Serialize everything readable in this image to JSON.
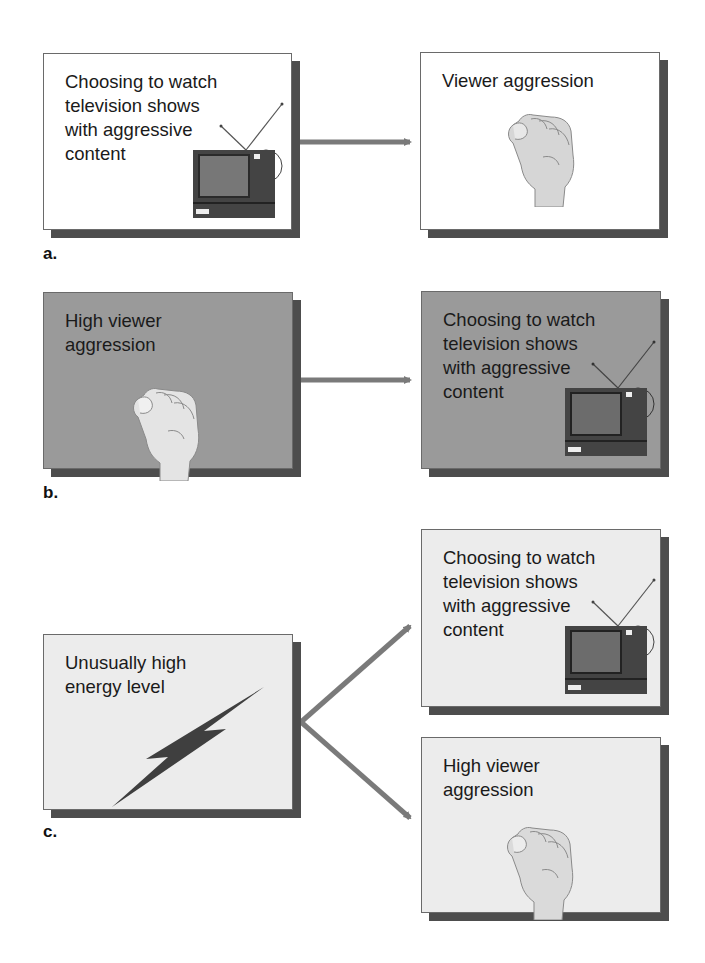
{
  "diagram": {
    "parts": [
      {
        "id": "a",
        "label": "a.",
        "source": {
          "text": "Choosing to watch\ntelevision shows\nwith aggressive\ncontent",
          "icon": "television-icon"
        },
        "targets": [
          {
            "text": "Viewer aggression",
            "icon": "fist-icon"
          }
        ]
      },
      {
        "id": "b",
        "label": "b.",
        "source": {
          "text": "High viewer\naggression",
          "icon": "fist-icon"
        },
        "targets": [
          {
            "text": "Choosing to watch\ntelevision shows\nwith aggressive\ncontent",
            "icon": "television-icon"
          }
        ]
      },
      {
        "id": "c",
        "label": "c.",
        "source": {
          "text": "Unusually high\nenergy level",
          "icon": "lightning-bolt-icon"
        },
        "targets": [
          {
            "text": "Choosing to watch\ntelevision shows\nwith aggressive\ncontent",
            "icon": "television-icon"
          },
          {
            "text": "High viewer\naggression",
            "icon": "fist-icon"
          }
        ]
      }
    ],
    "colors": {
      "arrow": "#7a7a7a",
      "shadow": "#4d4d4d",
      "panel_a": "#ffffff",
      "panel_b": "#9a9a9a",
      "panel_c": "#ececec"
    }
  }
}
